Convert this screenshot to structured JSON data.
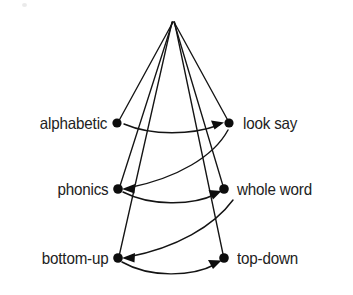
{
  "figure": {
    "background_color": "#ffffff",
    "ink_color": "#141414"
  },
  "apex": {
    "name": "apex-vertex",
    "x": 173,
    "y": 22
  },
  "nodes": [
    {
      "id": "alphabetic",
      "label": "alphabetic",
      "side": "left",
      "x": 117,
      "y": 123
    },
    {
      "id": "look-say",
      "label": "look say",
      "side": "right",
      "x": 229,
      "y": 123
    },
    {
      "id": "phonics",
      "label": "phonics",
      "side": "left",
      "x": 118,
      "y": 189
    },
    {
      "id": "whole-word",
      "label": "whole word",
      "side": "right",
      "x": 224,
      "y": 189
    },
    {
      "id": "bottom-up",
      "label": "bottom-up",
      "side": "left",
      "x": 118,
      "y": 258
    },
    {
      "id": "top-down",
      "label": "top-down",
      "side": "right",
      "x": 224,
      "y": 258
    }
  ],
  "radial_edges": [
    {
      "from": "apex",
      "to": "alphabetic"
    },
    {
      "from": "apex",
      "to": "look-say"
    },
    {
      "from": "apex",
      "to": "phonics"
    },
    {
      "from": "apex",
      "to": "whole-word"
    },
    {
      "from": "apex",
      "to": "bottom-up"
    },
    {
      "from": "apex",
      "to": "top-down"
    }
  ],
  "curved_edges": [
    {
      "id": "alphabetic-to-look-say",
      "from": "alphabetic",
      "to": "look-say",
      "direction": "left-to-right",
      "bow": "down"
    },
    {
      "id": "look-say-to-phonics",
      "from": "look-say",
      "to": "phonics",
      "direction": "right-to-left",
      "bow": "down"
    },
    {
      "id": "phonics-to-whole-word",
      "from": "phonics",
      "to": "whole-word",
      "direction": "left-to-right",
      "bow": "down"
    },
    {
      "id": "whole-word-to-bottom-up",
      "from": "whole-word",
      "to": "bottom-up",
      "direction": "right-to-left",
      "bow": "down"
    },
    {
      "id": "bottom-up-to-top-down",
      "from": "bottom-up",
      "to": "top-down",
      "direction": "left-to-right",
      "bow": "down"
    }
  ]
}
